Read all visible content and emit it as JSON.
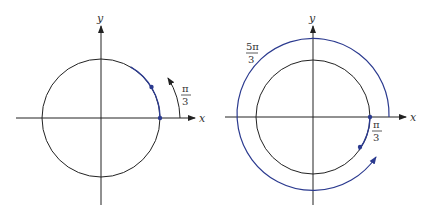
{
  "figures": [
    {
      "id": "left",
      "description": "Unit circle with angle pi/3 measured counterclockwise",
      "axis_x_label": "x",
      "axis_y_label": "y",
      "angle_label": {
        "numerator": "π",
        "denominator": "3"
      },
      "arc_start_deg": 0,
      "arc_end_deg": 60,
      "direction": "counterclockwise"
    },
    {
      "id": "right",
      "description": "Circle with angle -pi/3 measured clockwise, coterminal with 5pi/3",
      "axis_x_label": "x",
      "axis_y_label": "y",
      "angle_label_outer": {
        "numerator": "5π",
        "denominator": "3"
      },
      "angle_label_inner": {
        "numerator": "π",
        "denominator": "3"
      },
      "outer_arc_sweep_deg": 300,
      "inner_arc_start_deg": 0,
      "inner_arc_end_deg": -60,
      "direction": "clockwise"
    }
  ],
  "colors": {
    "stroke": "#222222",
    "arc": "#2b3a8f",
    "text": "#333333"
  }
}
